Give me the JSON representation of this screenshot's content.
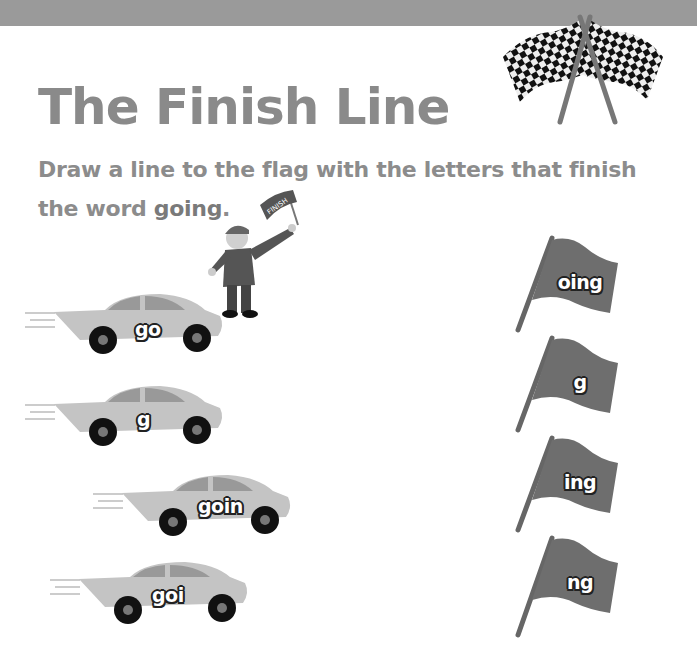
{
  "header": {
    "bar_color": "#9a9a9a"
  },
  "title": "The Finish Line",
  "instructions": {
    "prefix": "Draw a line to the flag with the letters that finish the word ",
    "keyword": "going",
    "suffix": "."
  },
  "flagman": {
    "flag_text": "FINISH"
  },
  "cars": [
    {
      "label": "go"
    },
    {
      "label": "g"
    },
    {
      "label": "goin"
    },
    {
      "label": "goi"
    }
  ],
  "flags": [
    {
      "label": "oing"
    },
    {
      "label": "g"
    },
    {
      "label": "ing"
    },
    {
      "label": "ng"
    }
  ],
  "colors": {
    "title": "#8a8a8a",
    "instructions": "#8c8c8c",
    "car_body": "#c4c4c4",
    "flag_cloth": "#6e6e6e"
  }
}
